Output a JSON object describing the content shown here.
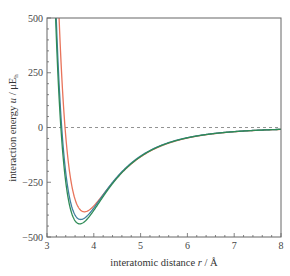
{
  "chart_data": {
    "type": "line",
    "title": "",
    "xlabel": "interatomic distance r / Å",
    "ylabel": "interaction energy u / μE_h",
    "xlim": [
      3,
      8
    ],
    "ylim": [
      -500,
      500
    ],
    "xticks": [
      3,
      4,
      5,
      6,
      7,
      8
    ],
    "yticks": [
      500,
      250,
      0,
      -250,
      -500
    ],
    "xtick_labels": [
      "3",
      "4",
      "5",
      "6",
      "7",
      "8"
    ],
    "ytick_labels": [
      "500",
      "250",
      "0",
      "−250",
      "−500"
    ],
    "grid": false,
    "legend": "none",
    "reference_line": {
      "y": 0,
      "style": "dashed"
    },
    "series": [
      {
        "name": "red curve",
        "color": "#e8735a",
        "r_min": 3.8,
        "u_min": -385,
        "sigma": 3.36,
        "x": [
          3.25,
          3.36,
          3.5,
          3.65,
          3.8,
          4.0,
          4.25,
          4.5,
          5.0,
          5.5,
          6.0,
          6.5,
          7.0,
          7.5,
          8.0
        ],
        "y": [
          500,
          0,
          -220,
          -345,
          -385,
          -355,
          -280,
          -205,
          -110,
          -60,
          -34,
          -20,
          -12,
          -8,
          -5
        ]
      },
      {
        "name": "blue curve",
        "color": "#3f7f9f",
        "r_min": 3.72,
        "u_min": -420,
        "sigma": 3.33,
        "x": [
          3.23,
          3.33,
          3.5,
          3.6,
          3.72,
          3.9,
          4.1,
          4.4,
          5.0,
          5.5,
          6.0,
          6.5,
          7.0,
          7.5,
          8.0
        ],
        "y": [
          500,
          0,
          -300,
          -385,
          -420,
          -395,
          -320,
          -225,
          -100,
          -52,
          -28,
          -16,
          -10,
          -6,
          -4
        ]
      },
      {
        "name": "green curve",
        "color": "#2e8b57",
        "r_min": 3.7,
        "u_min": -440,
        "sigma": 3.32,
        "x": [
          3.22,
          3.32,
          3.5,
          3.6,
          3.7,
          3.9,
          4.1,
          4.4,
          5.0,
          5.5,
          6.0,
          6.5,
          7.0,
          7.5,
          8.0
        ],
        "y": [
          500,
          0,
          -320,
          -405,
          -440,
          -410,
          -330,
          -230,
          -100,
          -52,
          -28,
          -16,
          -10,
          -6,
          -4
        ]
      }
    ]
  },
  "labels": {
    "xlabel_main": "interatomic distance ",
    "xlabel_var": "r",
    "xlabel_unit": " / Å",
    "ylabel_main": "interaction energy ",
    "ylabel_var": "u",
    "ylabel_unit": " / μE",
    "ylabel_sub": "h"
  },
  "colors": {
    "frame": "#666666",
    "zero_line": "#777777"
  }
}
